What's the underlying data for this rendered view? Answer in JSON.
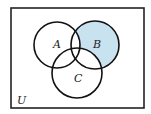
{
  "diagram": {
    "type": "venn",
    "universe_label": "U",
    "sets": [
      {
        "label": "A",
        "cx": 57,
        "cy": 45,
        "r": 23
      },
      {
        "label": "B",
        "cx": 95,
        "cy": 45,
        "r": 24
      },
      {
        "label": "C",
        "cx": 77,
        "cy": 73,
        "r": 25
      }
    ],
    "shaded_region": "B − (A ∪ C)",
    "colors": {
      "shade": "#c9e2ef",
      "stroke": "#111111",
      "background": "#ffffff"
    }
  }
}
